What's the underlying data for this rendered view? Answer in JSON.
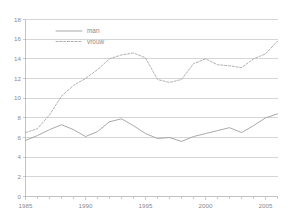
{
  "chart_data": {
    "type": "line",
    "title": "",
    "xlabel": "",
    "ylabel": "",
    "xlim": [
      1985,
      2006
    ],
    "ylim": [
      0,
      18
    ],
    "grid": true,
    "legend_position": "top-left",
    "yticks": [
      "0",
      "2",
      "4",
      "6",
      "8",
      "10",
      "12",
      "14",
      "16",
      "18"
    ],
    "ytick_values": [
      0,
      2,
      4,
      6,
      8,
      10,
      12,
      14,
      16,
      18
    ],
    "xticks": [
      "1985",
      "1990",
      "1995",
      "2000",
      "2005"
    ],
    "xtick_values": [
      1985,
      1990,
      1995,
      2000,
      2005
    ],
    "x": [
      1985,
      1986,
      1987,
      1988,
      1989,
      1990,
      1991,
      1992,
      1993,
      1994,
      1995,
      1996,
      1997,
      1998,
      1999,
      2000,
      2001,
      2002,
      2003,
      2004,
      2005,
      2006
    ],
    "series": [
      {
        "name": "man",
        "style": "solid",
        "color": "#9a9a9a",
        "values": [
          5.7,
          6.2,
          6.8,
          7.3,
          6.8,
          6.1,
          6.6,
          7.6,
          7.9,
          7.2,
          6.4,
          5.9,
          6.0,
          5.6,
          6.1,
          6.4,
          6.7,
          7.0,
          6.5,
          7.2,
          8.0,
          8.4
        ]
      },
      {
        "name": "vrouw",
        "style": "dashed",
        "color": "#a8a8a8",
        "values": [
          6.5,
          6.9,
          8.3,
          10.2,
          11.3,
          12.0,
          12.9,
          14.0,
          14.4,
          14.6,
          14.1,
          11.9,
          11.6,
          11.9,
          13.5,
          14.0,
          13.4,
          13.3,
          13.1,
          14.0,
          14.5,
          15.8
        ]
      }
    ]
  },
  "legend": {
    "items": [
      {
        "label": "man",
        "style": "solid"
      },
      {
        "label": "vrouw",
        "style": "dashed"
      }
    ]
  }
}
